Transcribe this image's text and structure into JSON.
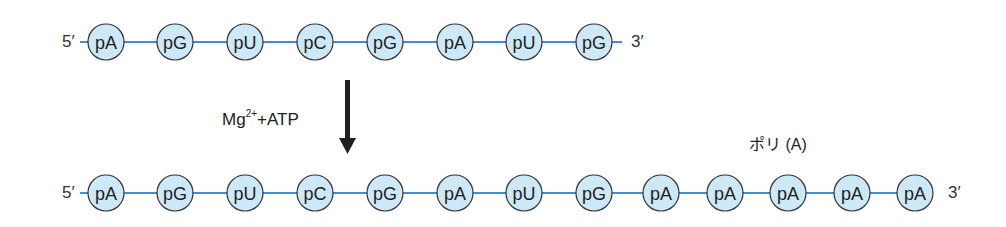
{
  "colors": {
    "circle_fill": "#cde8f7",
    "circle_stroke": "#333333",
    "bond": "#3f8fd2",
    "arrow": "#231f20"
  },
  "top_strand": {
    "five_prime": "5′",
    "three_prime": "3′",
    "nucleotides": [
      "pA",
      "pG",
      "pU",
      "pC",
      "pG",
      "pA",
      "pU",
      "pG"
    ]
  },
  "reaction": {
    "reagent_main": "Mg",
    "reagent_sup": "2+",
    "reagent_rest": "+ATP"
  },
  "poly_a_label": "ポリ (A)",
  "bottom_strand": {
    "five_prime": "5′",
    "three_prime": "3′",
    "nucleotides": [
      "pA",
      "pG",
      "pU",
      "pC",
      "pG",
      "pA",
      "pU",
      "pG",
      "pA",
      "pA",
      "pA",
      "pA",
      "pA"
    ]
  }
}
